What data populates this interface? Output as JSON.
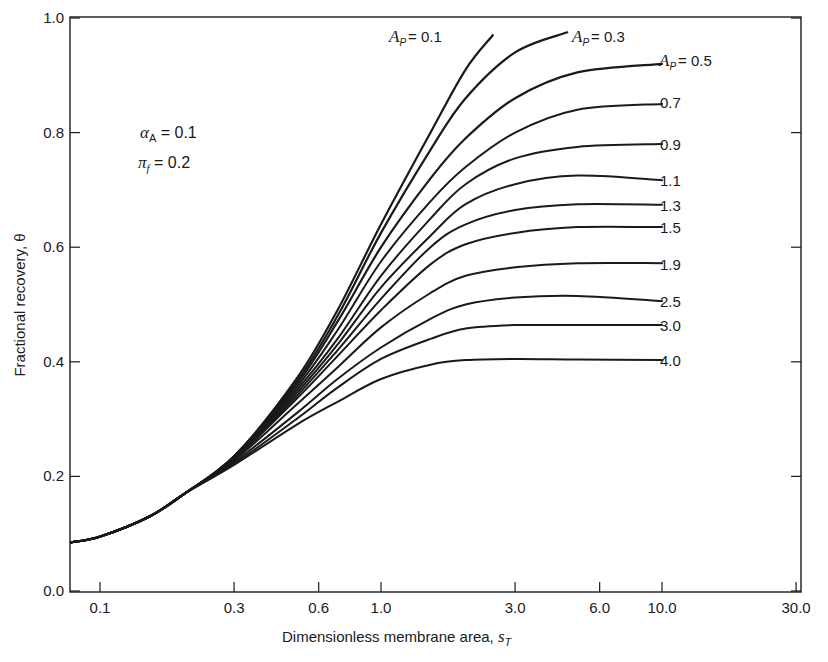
{
  "chart_data": {
    "type": "line",
    "title": "",
    "xlabel": "Dimensionless membrane area, s_T",
    "ylabel": "Fractional recovery, θ",
    "xscale": "log",
    "xlim": [
      0.07,
      30.0
    ],
    "ylim": [
      0.0,
      1.0
    ],
    "x_ticks": [
      "0.1",
      "0.3",
      "0.6",
      "1.0",
      "3.0",
      "6.0",
      "10.0",
      "30.0"
    ],
    "y_ticks": [
      "0.0",
      "0.2",
      "0.4",
      "0.6",
      "0.8",
      "1.0"
    ],
    "grid": false,
    "annotations": [
      "α_A = 0.1",
      "π_f = 0.2"
    ],
    "parameter": "A_P",
    "series": [
      {
        "name": "A_P = 0.1",
        "x": [
          0.07,
          0.1,
          0.15,
          0.2,
          0.3,
          0.5,
          0.7,
          1.0,
          1.5,
          2.0,
          2.5
        ],
        "y": [
          0.085,
          0.095,
          0.13,
          0.17,
          0.235,
          0.37,
          0.49,
          0.64,
          0.8,
          0.91,
          0.97
        ]
      },
      {
        "name": "A_P = 0.3",
        "x": [
          0.07,
          0.1,
          0.15,
          0.2,
          0.3,
          0.5,
          0.7,
          1.0,
          1.5,
          2.0,
          3.0,
          4.6
        ],
        "y": [
          0.085,
          0.095,
          0.13,
          0.17,
          0.235,
          0.365,
          0.48,
          0.625,
          0.77,
          0.86,
          0.94,
          0.975
        ]
      },
      {
        "name": "A_P = 0.5",
        "x": [
          0.07,
          0.1,
          0.15,
          0.2,
          0.3,
          0.5,
          0.7,
          1.0,
          1.5,
          2.0,
          3.0,
          5.0,
          10.0
        ],
        "y": [
          0.085,
          0.095,
          0.13,
          0.17,
          0.235,
          0.36,
          0.47,
          0.6,
          0.72,
          0.79,
          0.86,
          0.905,
          0.92
        ]
      },
      {
        "name": "0.7",
        "x": [
          0.07,
          0.1,
          0.15,
          0.2,
          0.3,
          0.5,
          0.7,
          1.0,
          1.5,
          2.0,
          3.0,
          5.0,
          10.0
        ],
        "y": [
          0.085,
          0.095,
          0.13,
          0.17,
          0.234,
          0.355,
          0.455,
          0.575,
          0.68,
          0.74,
          0.8,
          0.84,
          0.85
        ]
      },
      {
        "name": "0.9",
        "x": [
          0.07,
          0.1,
          0.15,
          0.2,
          0.3,
          0.5,
          0.7,
          1.0,
          1.5,
          2.0,
          3.0,
          5.0,
          10.0
        ],
        "y": [
          0.085,
          0.095,
          0.13,
          0.17,
          0.233,
          0.35,
          0.44,
          0.55,
          0.65,
          0.71,
          0.755,
          0.775,
          0.78
        ]
      },
      {
        "name": "1.1",
        "x": [
          0.07,
          0.1,
          0.15,
          0.2,
          0.3,
          0.5,
          0.7,
          1.0,
          1.5,
          2.0,
          3.0,
          5.0,
          10.0
        ],
        "y": [
          0.085,
          0.095,
          0.13,
          0.17,
          0.232,
          0.345,
          0.43,
          0.53,
          0.62,
          0.675,
          0.71,
          0.725,
          0.717
        ]
      },
      {
        "name": "1.3",
        "x": [
          0.07,
          0.1,
          0.15,
          0.2,
          0.3,
          0.5,
          0.7,
          1.0,
          1.5,
          2.0,
          3.0,
          5.0,
          10.0
        ],
        "y": [
          0.085,
          0.095,
          0.13,
          0.17,
          0.231,
          0.34,
          0.42,
          0.51,
          0.6,
          0.64,
          0.665,
          0.675,
          0.674
        ]
      },
      {
        "name": "1.5",
        "x": [
          0.07,
          0.1,
          0.15,
          0.2,
          0.3,
          0.5,
          0.7,
          1.0,
          1.5,
          2.0,
          3.0,
          5.0,
          10.0
        ],
        "y": [
          0.085,
          0.095,
          0.13,
          0.17,
          0.23,
          0.335,
          0.41,
          0.49,
          0.57,
          0.605,
          0.625,
          0.635,
          0.635
        ]
      },
      {
        "name": "1.9",
        "x": [
          0.07,
          0.1,
          0.15,
          0.2,
          0.3,
          0.5,
          0.7,
          1.0,
          1.5,
          2.0,
          3.0,
          5.0,
          10.0
        ],
        "y": [
          0.085,
          0.095,
          0.13,
          0.17,
          0.228,
          0.325,
          0.39,
          0.46,
          0.52,
          0.55,
          0.565,
          0.572,
          0.572
        ]
      },
      {
        "name": "2.5",
        "x": [
          0.07,
          0.1,
          0.15,
          0.2,
          0.3,
          0.5,
          0.7,
          1.0,
          1.5,
          2.0,
          3.0,
          5.0,
          10.0
        ],
        "y": [
          0.085,
          0.095,
          0.13,
          0.17,
          0.225,
          0.31,
          0.37,
          0.425,
          0.475,
          0.5,
          0.512,
          0.515,
          0.506
        ]
      },
      {
        "name": "3.0",
        "x": [
          0.07,
          0.1,
          0.15,
          0.2,
          0.3,
          0.5,
          0.7,
          1.0,
          1.5,
          2.0,
          3.0,
          5.0,
          10.0
        ],
        "y": [
          0.085,
          0.095,
          0.13,
          0.17,
          0.222,
          0.3,
          0.355,
          0.405,
          0.44,
          0.458,
          0.464,
          0.464,
          0.464
        ]
      },
      {
        "name": "4.0",
        "x": [
          0.07,
          0.1,
          0.15,
          0.2,
          0.3,
          0.5,
          0.7,
          1.0,
          1.5,
          2.0,
          3.0,
          5.0,
          10.0
        ],
        "y": [
          0.085,
          0.095,
          0.13,
          0.17,
          0.22,
          0.29,
          0.33,
          0.37,
          0.395,
          0.403,
          0.405,
          0.404,
          0.403
        ]
      }
    ],
    "curve_labels": [
      {
        "text": "A_P = 0.1",
        "series": 0
      },
      {
        "text": "A_P = 0.3",
        "series": 1
      },
      {
        "text": "A_P = 0.5",
        "series": 2
      },
      {
        "text": "0.7",
        "series": 3
      },
      {
        "text": "0.9",
        "series": 4
      },
      {
        "text": "1.1",
        "series": 5
      },
      {
        "text": "1.3",
        "series": 6
      },
      {
        "text": "1.5",
        "series": 7
      },
      {
        "text": "1.9",
        "series": 8
      },
      {
        "text": "2.5",
        "series": 9
      },
      {
        "text": "3.0",
        "series": 10
      },
      {
        "text": "4.0",
        "series": 11
      }
    ]
  },
  "labels": {
    "xlabel_main": "Dimensionless membrane area, ",
    "xlabel_sym": "s",
    "xlabel_sub": "T",
    "ylabel": "Fractional recovery, θ",
    "alpha_sym": "α",
    "alpha_sub": "A",
    "alpha_val": " = 0.1",
    "pi_sym": "π",
    "pi_sub": "f",
    "pi_val": " = 0.2",
    "ap_sym": "A",
    "ap_sub": "P",
    "ap01": "= 0.1",
    "ap03": "= 0.3",
    "ap05": "= 0.5",
    "l07": "0.7",
    "l09": "0.9",
    "l11": "1.1",
    "l13": "1.3",
    "l15": "1.5",
    "l19": "1.9",
    "l25": "2.5",
    "l30": "3.0",
    "l40": "4.0"
  },
  "colors": {
    "ink": "#1a1a1a",
    "background": "#ffffff"
  }
}
